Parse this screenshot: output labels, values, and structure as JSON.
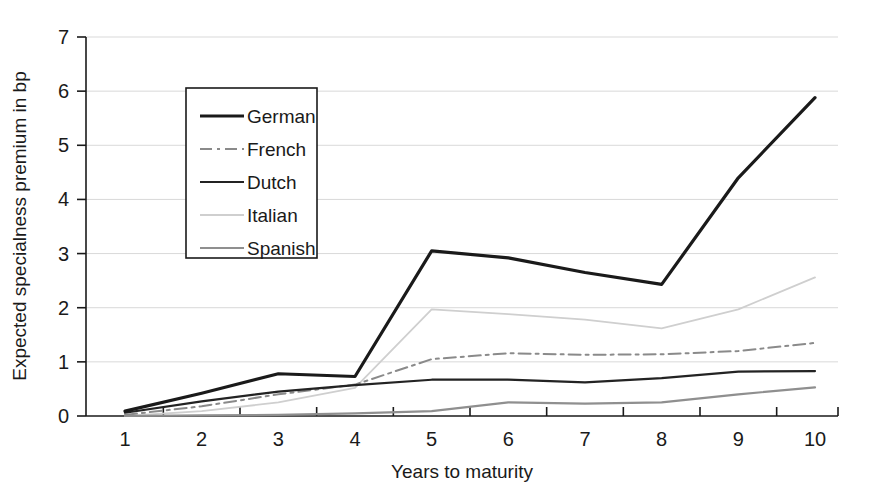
{
  "chart_data": {
    "type": "line",
    "title": "",
    "xlabel": "Years to maturity",
    "ylabel": "Expected specialness premium in bp",
    "x": [
      1,
      2,
      3,
      4,
      5,
      6,
      7,
      8,
      9,
      10
    ],
    "xlim": [
      1,
      10
    ],
    "ylim": [
      0,
      7
    ],
    "yticks": [
      0,
      1,
      2,
      3,
      4,
      5,
      6,
      7
    ],
    "xticks": [
      1,
      2,
      3,
      4,
      5,
      6,
      7,
      8,
      9,
      10
    ],
    "grid": "horizontal",
    "legend_position": "upper-left-inset",
    "series": [
      {
        "name": "German",
        "values": [
          0.09,
          0.42,
          0.78,
          0.73,
          3.05,
          2.92,
          2.65,
          2.43,
          4.4,
          5.88
        ],
        "color": "#1a1a1a",
        "width": 3.2,
        "dash": "none"
      },
      {
        "name": "French",
        "values": [
          0.02,
          0.18,
          0.4,
          0.58,
          1.05,
          1.16,
          1.13,
          1.14,
          1.2,
          1.35
        ],
        "color": "#8a8a8a",
        "width": 2.0,
        "dash": "12,5,3,5"
      },
      {
        "name": "Dutch",
        "values": [
          0.06,
          0.27,
          0.45,
          0.57,
          0.67,
          0.67,
          0.62,
          0.7,
          0.82,
          0.83
        ],
        "color": "#232323",
        "width": 2.2,
        "dash": "none"
      },
      {
        "name": "Italian",
        "values": [
          0.0,
          0.09,
          0.25,
          0.52,
          1.97,
          1.88,
          1.78,
          1.62,
          1.97,
          2.56
        ],
        "color": "#cfcfcf",
        "width": 1.8,
        "dash": "none"
      },
      {
        "name": "Spanish",
        "values": [
          0.0,
          0.01,
          0.02,
          0.05,
          0.09,
          0.25,
          0.23,
          0.25,
          0.4,
          0.53
        ],
        "color": "#8f8f8f",
        "width": 2.2,
        "dash": "none"
      }
    ]
  },
  "legend": {
    "items": [
      {
        "label": "German"
      },
      {
        "label": "French"
      },
      {
        "label": "Dutch"
      },
      {
        "label": "Italian"
      },
      {
        "label": "Spanish"
      }
    ]
  },
  "axes": {
    "y_title": "Expected specialness premium in bp",
    "x_title": "Years to maturity",
    "y_ticks": [
      "0",
      "1",
      "2",
      "3",
      "4",
      "5",
      "6",
      "7"
    ],
    "x_ticks": [
      "1",
      "2",
      "3",
      "4",
      "5",
      "6",
      "7",
      "8",
      "9",
      "10"
    ]
  },
  "colors": {
    "background": "#ffffff",
    "axis": "#1a1a1a",
    "grid": "#d9d9d9",
    "german": "#1a1a1a",
    "french": "#8a8a8a",
    "dutch": "#232323",
    "italian": "#cfcfcf",
    "spanish": "#8f8f8f"
  }
}
